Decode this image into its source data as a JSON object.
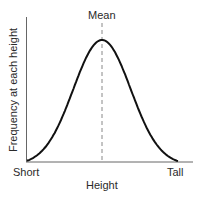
{
  "chart_data": {
    "type": "line",
    "title": "",
    "xlabel": "Height",
    "ylabel": "Frequency at each height",
    "x_tick_labels": [
      "Short",
      "Tall"
    ],
    "annotations": [
      {
        "text": "Mean",
        "type": "vertical-dashed-line",
        "x": "center"
      }
    ],
    "series": [
      {
        "name": "Normal distribution",
        "x": [
          0,
          0.1,
          0.2,
          0.3,
          0.4,
          0.5,
          0.6,
          0.7,
          0.8,
          0.9,
          1.0
        ],
        "values": [
          0.0,
          0.06,
          0.2,
          0.47,
          0.8,
          1.0,
          0.8,
          0.47,
          0.2,
          0.06,
          0.0
        ]
      }
    ],
    "grid": false,
    "legend": null
  },
  "labels": {
    "mean": "Mean",
    "short": "Short",
    "tall": "Tall",
    "xlabel": "Height",
    "ylabel": "Frequency at each height"
  },
  "colors": {
    "curve": "#111111",
    "axis": "#555555",
    "mean_line": "#888888"
  }
}
